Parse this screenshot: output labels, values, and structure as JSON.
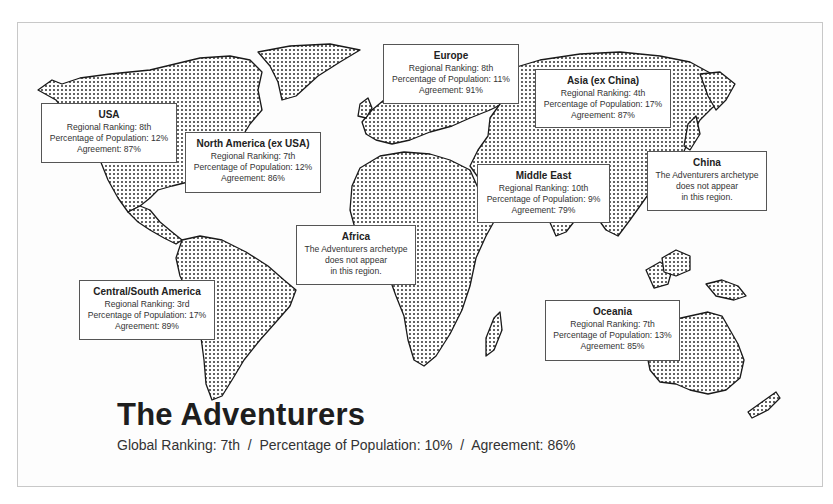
{
  "figure": {
    "title": "The Adventurers",
    "summary": {
      "global_ranking": "Global Ranking: 7th",
      "percentage": "Percentage of Population: 10%",
      "agreement": "Agreement: 86%",
      "separator": "  /  "
    }
  },
  "regions": [
    {
      "id": "usa",
      "name": "USA",
      "lines": [
        "Regional Ranking: 8th",
        "Percentage of Population: 12%",
        "Agreement: 87%"
      ]
    },
    {
      "id": "north-america",
      "name": "North America (ex USA)",
      "lines": [
        "Regional Ranking: 7th",
        "Percentage of Population: 12%",
        "Agreement: 86%"
      ]
    },
    {
      "id": "europe",
      "name": "Europe",
      "lines": [
        "Regional Ranking: 8th",
        "Percentage of Population: 11%",
        "Agreement: 91%"
      ]
    },
    {
      "id": "asia",
      "name": "Asia (ex China)",
      "lines": [
        "Regional Ranking: 4th",
        "Percentage of Population: 17%",
        "Agreement: 87%"
      ]
    },
    {
      "id": "middle-east",
      "name": "Middle East",
      "lines": [
        "Regional Ranking: 10th",
        "Percentage of Population: 9%",
        "Agreement: 79%"
      ]
    },
    {
      "id": "china",
      "name": "China",
      "lines": [
        "The Adventurers archetype",
        "does not appear",
        "in this region."
      ]
    },
    {
      "id": "africa",
      "name": "Africa",
      "lines": [
        "The Adventurers archetype",
        "does not appear",
        "in this region."
      ]
    },
    {
      "id": "central-south-america",
      "name": "Central/South America",
      "lines": [
        "Regional Ranking: 3rd",
        "Percentage of Population: 17%",
        "Agreement: 89%"
      ]
    },
    {
      "id": "oceania",
      "name": "Oceania",
      "lines": [
        "Regional Ranking: 7th",
        "Percentage of Population: 13%",
        "Agreement: 85%"
      ]
    }
  ],
  "colors": {
    "land_dots": "#222222",
    "border": "#555555",
    "background": "#ffffff"
  }
}
